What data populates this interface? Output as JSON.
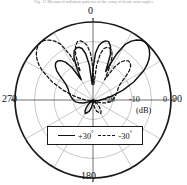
{
  "figure": {
    "caption_top": "Fig. 12  Measured radiation patterns of the array at beam scan angles",
    "type": "polar-radiation-pattern",
    "units": "(dB)"
  },
  "axes": {
    "angle_labels": [
      {
        "text": "0",
        "deg": 0
      },
      {
        "text": "90",
        "deg": 90
      },
      {
        "text": "180",
        "deg": 180
      },
      {
        "text": "270",
        "deg": 270
      }
    ],
    "radial_labels": [
      {
        "text": "-20",
        "db": -20
      },
      {
        "text": "-10",
        "db": -10
      },
      {
        "text": "0",
        "db": 0
      }
    ],
    "radial_unit_label": "(dB)"
  },
  "legend": {
    "entries": [
      {
        "label": "+30",
        "degree_symbol": "°",
        "style": "solid"
      },
      {
        "label": "-30",
        "degree_symbol": "°",
        "style": "dashed"
      }
    ]
  },
  "chart_data": {
    "type": "line",
    "subtype": "polar",
    "title": "",
    "xlabel": "Angle (degrees)",
    "ylabel": "Normalized magnitude (dB)",
    "rlim": [
      -40,
      0
    ],
    "r_ticks": [
      -40,
      -30,
      -20,
      -10,
      0
    ],
    "r_tick_labels": [
      "",
      "",
      "-20",
      "-10",
      "0"
    ],
    "theta_ticks": [
      0,
      30,
      60,
      90,
      120,
      150,
      180,
      210,
      240,
      270,
      300,
      330
    ],
    "theta_tick_labels": [
      "0",
      "",
      "",
      "90",
      "",
      "",
      "180",
      "",
      "",
      "270",
      "",
      ""
    ],
    "theta_zero_location": "N",
    "theta_direction": "clockwise",
    "grid": true,
    "legend_position": "inside-bottom-center",
    "series": [
      {
        "name": "+30°",
        "style": "solid",
        "color": "#111111",
        "theta": [
          -180,
          -174,
          -168,
          -162,
          -156,
          -150,
          -144,
          -138,
          -132,
          -126,
          -120,
          -114,
          -108,
          -102,
          -96,
          -90,
          -84,
          -78,
          -72,
          -66,
          -60,
          -57,
          -54,
          -51,
          -48,
          -45,
          -42,
          -39,
          -36,
          -33,
          -30,
          -27,
          -24,
          -21,
          -18,
          -15,
          -12,
          -9,
          -6,
          -3,
          0,
          3,
          6,
          9,
          12,
          15,
          18,
          21,
          24,
          27,
          30,
          33,
          36,
          39,
          42,
          45,
          48,
          51,
          54,
          57,
          60,
          66,
          72,
          78,
          84,
          90,
          96,
          102,
          108,
          114,
          120,
          126,
          132,
          138,
          144,
          150,
          156,
          162,
          168,
          174,
          180
        ],
        "r_db": [
          -40,
          -38,
          -36,
          -34,
          -33,
          -32,
          -33,
          -35,
          -37,
          -39,
          -40,
          -38,
          -35,
          -33,
          -31,
          -30,
          -29,
          -28,
          -27,
          -26,
          -24,
          -22,
          -19,
          -16,
          -14,
          -13,
          -13,
          -14,
          -16,
          -20,
          -28,
          -22,
          -16,
          -13,
          -12,
          -12,
          -13,
          -16,
          -22,
          -32,
          -24,
          -16,
          -12,
          -10,
          -9,
          -9,
          -11,
          -15,
          -24,
          -14,
          -7,
          -4,
          -2,
          -0.6,
          0,
          -0.3,
          -1.2,
          -2.6,
          -4.5,
          -7,
          -10,
          -17,
          -24,
          -30,
          -34,
          -36,
          -37,
          -38,
          -39,
          -40,
          -40,
          -39,
          -38,
          -38,
          -39,
          -40,
          -40,
          -39,
          -39,
          -40
        ]
      },
      {
        "name": "-30°",
        "style": "dashed",
        "color": "#111111",
        "theta": [
          180,
          174,
          168,
          162,
          156,
          150,
          144,
          138,
          132,
          126,
          120,
          114,
          108,
          102,
          96,
          90,
          84,
          78,
          72,
          66,
          60,
          57,
          54,
          51,
          48,
          45,
          42,
          39,
          36,
          33,
          30,
          27,
          24,
          21,
          18,
          15,
          12,
          9,
          6,
          3,
          0,
          -3,
          -6,
          -9,
          -12,
          -15,
          -18,
          -21,
          -24,
          -27,
          -30,
          -33,
          -36,
          -39,
          -42,
          -45,
          -48,
          -51,
          -54,
          -57,
          -60,
          -66,
          -72,
          -78,
          -84,
          -90,
          -96,
          -102,
          -108,
          -114,
          -120,
          -126,
          -132,
          -138,
          -144,
          -150,
          -156,
          -162,
          -168,
          -174,
          -180
        ],
        "r_db": [
          -40,
          -38,
          -36,
          -34,
          -33,
          -32,
          -33,
          -35,
          -37,
          -39,
          -40,
          -38,
          -35,
          -33,
          -31,
          -30,
          -29,
          -28,
          -27,
          -26,
          -24,
          -22,
          -19,
          -16,
          -14,
          -13,
          -13,
          -14,
          -16,
          -20,
          -28,
          -22,
          -16,
          -13,
          -12,
          -12,
          -13,
          -16,
          -22,
          -32,
          -24,
          -16,
          -12,
          -10,
          -9,
          -9,
          -11,
          -15,
          -24,
          -14,
          -7,
          -4,
          -2,
          -0.6,
          0,
          -0.3,
          -1.2,
          -2.6,
          -4.5,
          -7,
          -10,
          -17,
          -24,
          -30,
          -34,
          -36,
          -37,
          -38,
          -39,
          -40,
          -40,
          -39,
          -38,
          -38,
          -39,
          -40,
          -40,
          -39,
          -39,
          -40
        ]
      }
    ]
  },
  "geometry": {
    "cx": 93,
    "cy": 100,
    "r_outer": 78,
    "ring_db": [
      -10,
      -20,
      -30,
      -40
    ],
    "spoke_step_deg": 30
  }
}
